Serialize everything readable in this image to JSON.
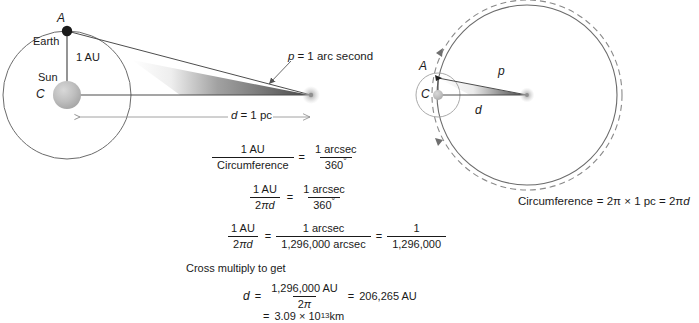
{
  "figure": {
    "background_color": "#ffffff",
    "line_color": "#4d4d4d",
    "text_color": "#1a1a1a",
    "wedge_color": "#555555",
    "sun_color": "#b3b3b3",
    "earth_color": "#1a1a1a"
  },
  "left_diagram": {
    "name": "parallax-geometry",
    "labels": {
      "point_a": "A",
      "earth": "Earth",
      "baseline": "1 AU",
      "sun": "Sun",
      "point_c": "C",
      "distance": "d = 1 pc",
      "distance_symbol": "d",
      "distance_value": "= 1 pc",
      "parallax": "p = 1 arc second",
      "parallax_symbol": "p",
      "parallax_value": "= 1 arc second"
    }
  },
  "right_diagram": {
    "name": "circumference-geometry",
    "labels": {
      "point_a": "A",
      "point_c": "C",
      "parallax_symbol": "p",
      "distance_symbol": "d",
      "circumference": "Circumference = 2π × 1 pc = 2πd",
      "circumference_prefix": "Circumference",
      "circumference_body": "= 2π × 1 pc = 2π",
      "circumference_suffix": "d"
    }
  },
  "equations": {
    "eq1": {
      "left_num": "1 AU",
      "left_den": "Circumference",
      "eq": "=",
      "right_num": "1 arcsec",
      "right_den": "360",
      "right_den_deg": "°"
    },
    "eq2": {
      "left_num": "1 AU",
      "left_den_pre": "2",
      "left_den_pi": "π",
      "left_den_d": "d",
      "eq": "=",
      "right_num": "1 arcsec",
      "right_den": "360",
      "right_den_deg": "°"
    },
    "eq3": {
      "left_num": "1 AU",
      "left_den_pre": "2",
      "left_den_pi": "π",
      "left_den_d": "d",
      "eq1": "=",
      "mid_num": "1 arcsec",
      "mid_den": "1,296,000 arcsec",
      "eq2": "=",
      "right_num": "1",
      "right_den": "1,296,000"
    },
    "cross_multiply_note": "Cross multiply to get",
    "eq4": {
      "lhs": "d",
      "eq1": "=",
      "num": "1,296,000 AU",
      "den_pre": "2",
      "den_pi": "π",
      "eq2": "=",
      "result": "206,265 AU"
    },
    "eq5": {
      "eq": "=",
      "value": "3.09 × 10",
      "exponent": "13",
      "unit": " km"
    }
  }
}
